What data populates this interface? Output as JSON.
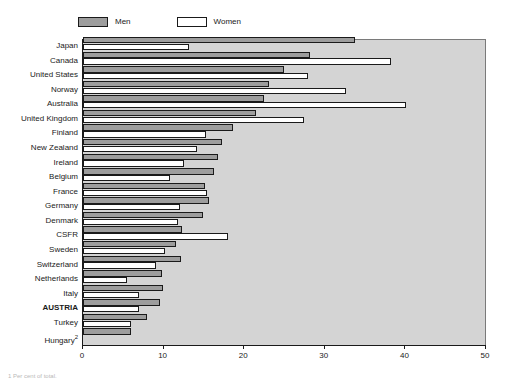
{
  "legend": {
    "items": [
      {
        "label": "Men",
        "key": "men",
        "color": "#9d9d9d"
      },
      {
        "label": "Women",
        "key": "women",
        "color": "#ffffff"
      }
    ]
  },
  "axis": {
    "x_ticks": [
      "0",
      "10",
      "20",
      "30",
      "40",
      "50"
    ],
    "x_min": 0,
    "x_max": 50
  },
  "footnote": {
    "text": "1   Per cent of total."
  },
  "colors": {
    "plot_background": "#d4d4d4",
    "men_fill": "#9d9d9d",
    "women_fill": "#ffffff",
    "outline": "#1a1a1a",
    "page_background": "#ffffff"
  },
  "chart_data": {
    "type": "bar",
    "orientation": "horizontal",
    "title": "",
    "xlabel": "",
    "ylabel": "",
    "xlim": [
      0,
      50
    ],
    "grid": false,
    "legend_position": "top",
    "categories": [
      "Japan",
      "Canada",
      "United States",
      "Norway",
      "Australia",
      "United Kingdom",
      "Finland",
      "New Zealand",
      "Ireland",
      "Belgium",
      "France",
      "Germany",
      "Denmark",
      "CSFR",
      "Sweden",
      "Switzerland",
      "Netherlands",
      "Italy",
      "AUSTRIA",
      "Turkey",
      "Hungary"
    ],
    "highlight_category": "AUSTRIA",
    "category_notes": {
      "Hungary": "2"
    },
    "series": [
      {
        "name": "Men",
        "values": [
          33.8,
          28.2,
          24.9,
          23.1,
          22.4,
          21.5,
          18.6,
          17.2,
          16.8,
          16.3,
          15.1,
          15.6,
          14.9,
          12.3,
          11.5,
          12.1,
          9.8,
          9.9,
          9.5,
          8.0,
          6.0
        ]
      },
      {
        "name": "Women",
        "values": [
          13.2,
          38.2,
          27.9,
          32.6,
          40.1,
          27.4,
          15.2,
          14.2,
          12.5,
          10.8,
          15.4,
          12.0,
          11.8,
          18.0,
          10.2,
          9.1,
          5.4,
          6.9,
          7.0,
          5.9,
          0.0
        ]
      }
    ]
  }
}
